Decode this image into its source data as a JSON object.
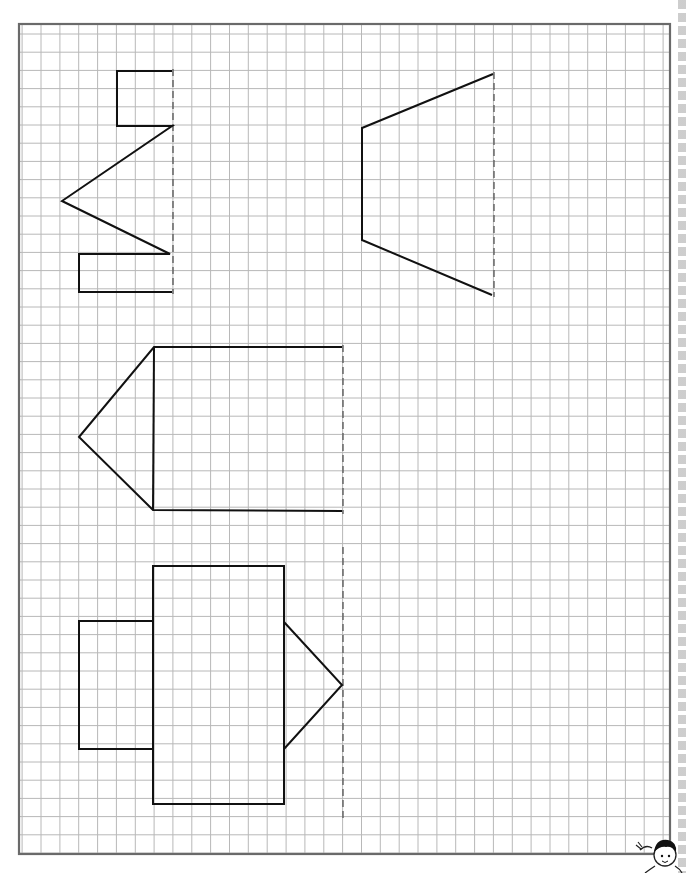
{
  "worksheet": {
    "title": "Symmetry: complete the figure across the dashed line",
    "grid": {
      "border": {
        "left": 19,
        "top": 24,
        "right": 670,
        "bottom": 854
      },
      "x0": 41,
      "dx": 18.85,
      "cols": 34,
      "y0": 34,
      "dy": 18.2,
      "rows": 45,
      "line_color": "#b8b8b8",
      "border_color": "#6a6a6a"
    },
    "colors": {
      "shape_stroke": "#111111",
      "axis_stroke": "#555555",
      "paper": "#ffffff"
    },
    "figures": [
      {
        "name": "zigzag-half",
        "polyline": [
          [
            172,
            71
          ],
          [
            117,
            71
          ],
          [
            117,
            126
          ],
          [
            172,
            126
          ],
          [
            62,
            201
          ],
          [
            170,
            254
          ],
          [
            79,
            254
          ],
          [
            79,
            292
          ],
          [
            172,
            292
          ]
        ],
        "axis": {
          "x": 173,
          "y1": 69,
          "y2": 294
        }
      },
      {
        "name": "trapezoid-half",
        "polyline": [
          [
            493,
            74
          ],
          [
            362,
            128
          ],
          [
            362,
            240
          ],
          [
            492,
            295
          ]
        ],
        "axis": {
          "x": 494,
          "y1": 72,
          "y2": 297
        }
      },
      {
        "name": "arrow-half",
        "polyline": [
          [
            342,
            347
          ],
          [
            154,
            347
          ],
          [
            79,
            437
          ],
          [
            153,
            510
          ],
          [
            342,
            511
          ]
        ],
        "extra_lines": [
          [
            [
              154,
              347
            ],
            [
              153,
              510
            ]
          ]
        ],
        "axis": {
          "x": 343,
          "y1": 345,
          "y2": 514
        }
      },
      {
        "name": "robot-half",
        "rects": [
          [
            153,
            566,
            131,
            238
          ],
          [
            79,
            621,
            74,
            128
          ]
        ],
        "polyline": [
          [
            284,
            622
          ],
          [
            342,
            685
          ],
          [
            284,
            749
          ]
        ],
        "axis": {
          "x": 343,
          "y1": 547,
          "y2": 818
        }
      }
    ],
    "mascot": {
      "description": "cartoon boy waving",
      "x": 652,
      "y": 838
    }
  }
}
